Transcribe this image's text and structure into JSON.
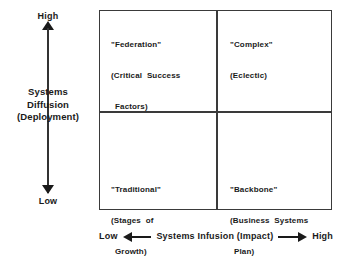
{
  "chart_data": {
    "type": "table",
    "title": "",
    "xlabel": "Systems Infusion (Impact)",
    "ylabel": "Systems Diffusion (Deployment)",
    "x_axis": {
      "label": "Systems Infusion (Impact)",
      "low_label": "Low",
      "high_label": "High",
      "direction": "low-to-high left-to-right"
    },
    "y_axis": {
      "label_line1": "Systems",
      "label_line2": "Diffusion",
      "label_line3": "(Deployment)",
      "low_label": "Low",
      "high_label": "High",
      "direction": "low-to-high bottom-to-top"
    },
    "grid": true,
    "legend": "none",
    "quadrants": [
      {
        "id": "federation",
        "position": "top-left",
        "x": "low",
        "y": "high",
        "name": "\"Federation\"",
        "subtitle_lines": [
          "(Critical  Success",
          "Factors)"
        ]
      },
      {
        "id": "complex",
        "position": "top-right",
        "x": "high",
        "y": "high",
        "name": "\"Complex\"",
        "subtitle_lines": [
          "(Eclectic)"
        ]
      },
      {
        "id": "traditional",
        "position": "bottom-left",
        "x": "low",
        "y": "low",
        "name": "\"Traditional\"",
        "subtitle_lines": [
          "(Stages  of",
          "Growth)"
        ]
      },
      {
        "id": "backbone",
        "position": "bottom-right",
        "x": "high",
        "y": "low",
        "name": "\"Backbone\"",
        "subtitle_lines": [
          "(Business  Systems",
          "Plan)"
        ]
      }
    ],
    "colors": {
      "line": "#3a3a3a",
      "text": "#1a1a1a",
      "background": "#ffffff"
    }
  },
  "y_axis": {
    "high": "High",
    "low": "Low",
    "title_line1": "Systems",
    "title_line2": "Diffusion",
    "title_line3": "(Deployment)"
  },
  "x_axis": {
    "low": "Low",
    "high": "High",
    "title": "Systems  Infusion  (Impact)"
  },
  "quadrants": {
    "federation": {
      "line1": "\"Federation\"",
      "line2": "(Critical  Success",
      "line3": "Factors)"
    },
    "complex": {
      "line1": "\"Complex\"",
      "line2": "(Eclectic)"
    },
    "traditional": {
      "line1": "\"Traditional\"",
      "line2": "(Stages  of",
      "line3": "Growth)"
    },
    "backbone": {
      "line1": "\"Backbone\"",
      "line2": "(Business  Systems",
      "line3": "Plan)"
    }
  }
}
